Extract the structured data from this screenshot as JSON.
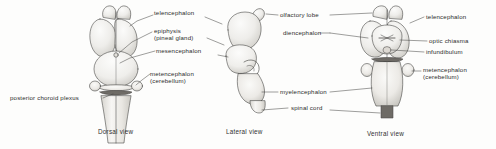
{
  "figure": {
    "background_color": "#fdfdfc",
    "ink_color": "#2b2b2b"
  },
  "views": [
    {
      "id": "dorsal",
      "caption": "Dorsal view"
    },
    {
      "id": "lateral",
      "caption": "Lateral view"
    },
    {
      "id": "ventral",
      "caption": "Ventral view"
    }
  ],
  "labels": {
    "dorsal": [
      {
        "name": "telencephalon",
        "line1": "telencephalon",
        "line2": ""
      },
      {
        "name": "epiphysis",
        "line1": "epiphysis",
        "line2": "(pineal gland)"
      },
      {
        "name": "mesencephalon",
        "line1": "mesencephalon",
        "line2": ""
      },
      {
        "name": "metencephalon",
        "line1": "metencephalon",
        "line2": "(cerebellum)"
      },
      {
        "name": "posterior-choroid-plexus",
        "line1": "posterior choroid plexus",
        "line2": ""
      }
    ],
    "lateral": [
      {
        "name": "olfactory-lobe",
        "line1": "olfactory  lobe",
        "line2": ""
      },
      {
        "name": "diencephalon",
        "line1": "diencephalon",
        "line2": ""
      },
      {
        "name": "myelencephalon",
        "line1": "myelencephalon",
        "line2": ""
      },
      {
        "name": "spinal-cord",
        "line1": "spinal cord",
        "line2": ""
      }
    ],
    "ventral": [
      {
        "name": "telencephalon",
        "line1": "telencephalon",
        "line2": ""
      },
      {
        "name": "optic-chiasma",
        "line1": "optic chiasma",
        "line2": ""
      },
      {
        "name": "infundibulum",
        "line1": "infundibulum",
        "line2": ""
      },
      {
        "name": "metencephalon",
        "line1": "metencephalon",
        "line2": "(cerebellum)"
      }
    ]
  }
}
